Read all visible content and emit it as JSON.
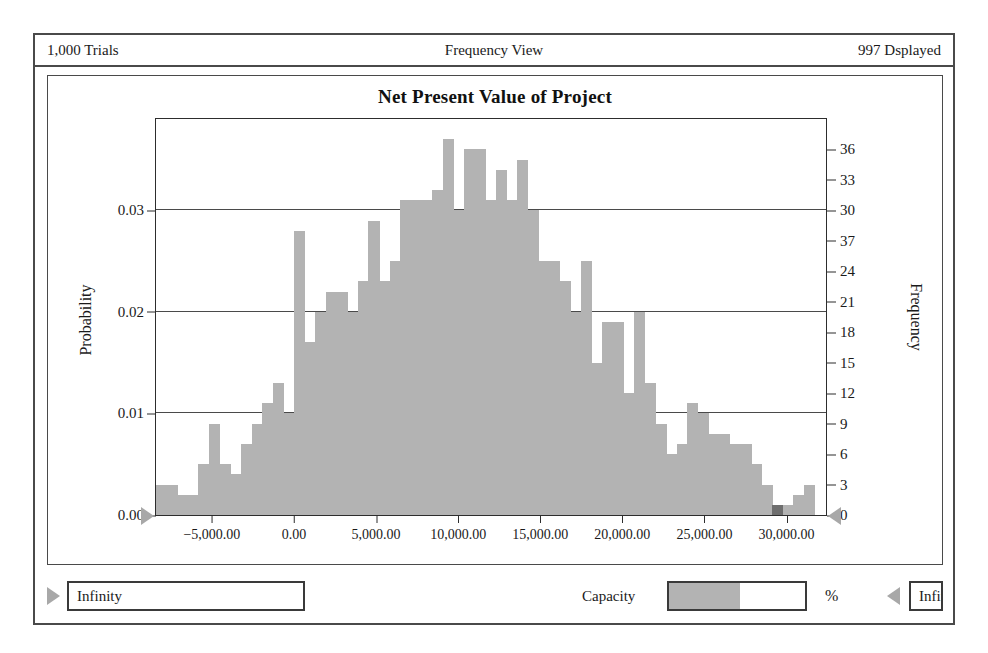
{
  "header": {
    "trials": "1,000 Trials",
    "view_title": "Frequency View",
    "displayed": "997 Dsplayed"
  },
  "controls": {
    "lower_bound_value": "Infinity",
    "upper_bound_value": "Infinity",
    "capacity_label": "Capacity",
    "percent_label": "%",
    "capacity_value": "",
    "lower_grabber_icon": "right-pointing-triangle-icon",
    "upper_grabber_icon": "left-pointing-triangle-icon"
  },
  "chart_data": {
    "type": "bar",
    "title": "Net Present Value of Project",
    "xlabel": "",
    "ylabel": "Probability",
    "y2label": "Frequency",
    "grid": true,
    "legend": null,
    "xlim": [
      -8400,
      32400
    ],
    "ylim": [
      0,
      0.039
    ],
    "y2lim": [
      0,
      39
    ],
    "xticks": [
      -5000,
      0,
      5000,
      10000,
      15000,
      20000,
      25000,
      30000
    ],
    "xticklabels": [
      "−5,000.00",
      "0.00",
      "5,000.00",
      "10,000.00",
      "15,000.00",
      "20,000.00",
      "25,000.00",
      "30,000.00"
    ],
    "yticks": [
      0,
      0.01,
      0.02,
      0.03
    ],
    "yticklabels": [
      "0.00",
      "0.01",
      "0.02",
      "0.03"
    ],
    "y2ticks": [
      0,
      3,
      6,
      9,
      12,
      15,
      18,
      21,
      24,
      27,
      30,
      33,
      36
    ],
    "y2ticklabels": [
      "0",
      "3",
      "6",
      "9",
      "12",
      "15",
      "18",
      "21",
      "24",
      "37",
      "30",
      "33",
      "36"
    ],
    "bin_width": 647,
    "bin_starts": [
      -8400,
      -7753,
      -7106,
      -6459,
      -5812,
      -5165,
      -4518,
      -3871,
      -3224,
      -2577,
      -1930,
      -1283,
      -636,
      11,
      658,
      1305,
      1952,
      2599,
      3246,
      3893,
      4540,
      5187,
      5834,
      6481,
      7128,
      7775,
      8422,
      9069,
      9716,
      10363,
      11010,
      11657,
      12304,
      12951,
      13598,
      14245,
      14892,
      15539,
      16186,
      16833,
      17480,
      18127,
      18774,
      19421,
      20068,
      20715,
      21362,
      22009,
      22656,
      23303,
      23950,
      24597,
      25244,
      25891,
      26538,
      27185,
      27832,
      28479,
      29126,
      29773,
      30420,
      31067,
      31714
    ],
    "frequencies": [
      3,
      3,
      2,
      2,
      5,
      9,
      5,
      4,
      7,
      9,
      11,
      13,
      10,
      28,
      17,
      20,
      22,
      22,
      20,
      23,
      29,
      23,
      25,
      31,
      31,
      31,
      32,
      37,
      30,
      36,
      36,
      31,
      34,
      31,
      35,
      30,
      25,
      25,
      23,
      20,
      25,
      15,
      19,
      19,
      12,
      20,
      13,
      9,
      6,
      7,
      11,
      10,
      8,
      8,
      7,
      7,
      5,
      3,
      1,
      1,
      2,
      3
    ],
    "highlight_bins": [
      58
    ],
    "bar_color": "#b3b3b3",
    "highlight_color": "#6e6e6e"
  }
}
